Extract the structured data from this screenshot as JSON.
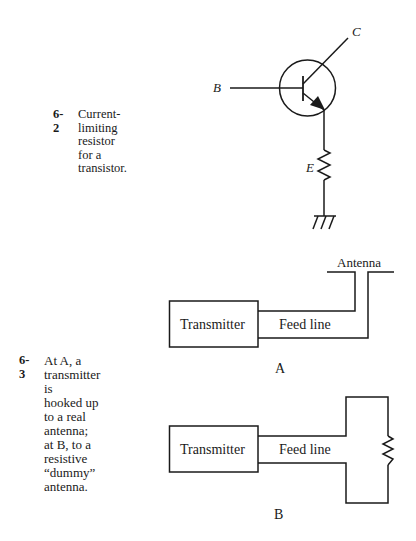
{
  "figures": [
    {
      "number": "6-2",
      "caption": "Current-limiting resistor\nfor a transistor.",
      "labels": {
        "base": "B",
        "collector": "C",
        "emitter": "E"
      }
    },
    {
      "number": "6-3",
      "caption": "At A, a transmitter is\nhooked up to a real\nantenna; at B, to a\nresistive “dummy”\nantenna.",
      "panel_a": {
        "label": "A",
        "transmitter": "Transmitter",
        "feed_line": "Feed line",
        "antenna": "Antenna"
      },
      "panel_b": {
        "label": "B",
        "transmitter": "Transmitter",
        "feed_line": "Feed line"
      }
    }
  ]
}
